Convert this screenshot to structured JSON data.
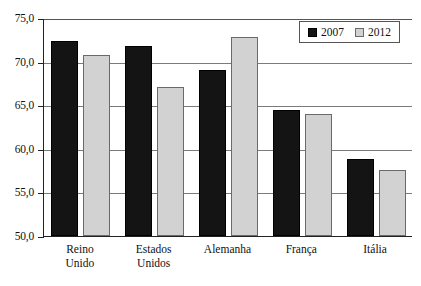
{
  "chart_data": {
    "type": "bar",
    "title": "",
    "subtitle": "",
    "xlabel": "",
    "ylabel": "",
    "ylim": [
      50.0,
      75.0
    ],
    "ytick_labels": [
      "75,0",
      "70,0",
      "65,0",
      "60,0",
      "55,0",
      "50,0"
    ],
    "ytick_values": [
      75.0,
      70.0,
      65.0,
      60.0,
      55.0,
      50.0
    ],
    "grid": true,
    "legend_position": "top-right",
    "decimal_separator": ",",
    "categories": [
      "Reino\nUnido",
      "Estados\nUnidos",
      "Alemanha",
      "França",
      "Itália"
    ],
    "category_labels_flat": [
      "Reino Unido",
      "Estados Unidos",
      "Alemanha",
      "França",
      "Itália"
    ],
    "series": [
      {
        "name": "2007",
        "color": "#141414",
        "values": [
          72.4,
          71.8,
          69.0,
          64.4,
          58.8
        ]
      },
      {
        "name": "2012",
        "color": "#d2d2d2",
        "values": [
          70.8,
          67.1,
          72.8,
          64.0,
          57.6
        ]
      }
    ]
  },
  "legend": {
    "entries": [
      {
        "label": "2007",
        "swatch": "black-square-swatch"
      },
      {
        "label": "2012",
        "swatch": "light-gray-square-swatch"
      }
    ]
  },
  "colors": {
    "series_2007": "#141414",
    "series_2012": "#d2d2d2",
    "axis": "#222222",
    "gridline": "#7b7b7b",
    "background": "#ffffff",
    "text": "#111111"
  }
}
